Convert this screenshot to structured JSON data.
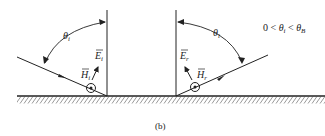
{
  "figure": {
    "caption": "(b)",
    "condition": {
      "lhs": "0 <",
      "theta": "θ",
      "theta_sub": "i",
      "mid": "<",
      "theta_b": "θ",
      "theta_b_sub": "B"
    },
    "incident": {
      "angle_label": "θ",
      "angle_sub": "i",
      "e_label": "E",
      "e_sub": "i",
      "h_label": "H",
      "h_sub": "i"
    },
    "reflected": {
      "angle_label": "θ",
      "angle_sub": "i",
      "e_label": "E",
      "e_sub": "r",
      "h_label": "H",
      "h_sub": "r"
    },
    "colors": {
      "ink": "#222222",
      "background": "#ffffff"
    }
  }
}
